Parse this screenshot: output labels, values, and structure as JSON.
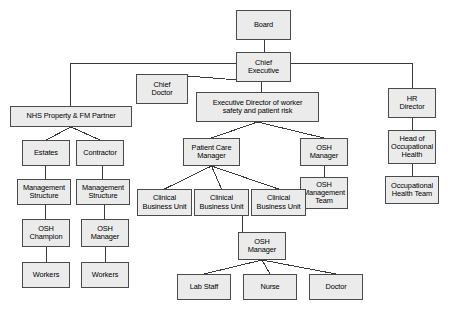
{
  "diagram": {
    "type": "organizational-chart",
    "background_color": "#ffffff",
    "node_fill_color": "#ebebeb",
    "node_border_color": "#4a4a4a",
    "connector_color": "#3a3a3a",
    "nodes": [
      {
        "id": "board",
        "label": "Board",
        "x": 236,
        "y": 10,
        "w": 55,
        "h": 30
      },
      {
        "id": "chief_executive",
        "label": "Chief\nExecutive",
        "x": 236,
        "y": 52,
        "w": 55,
        "h": 30
      },
      {
        "id": "chief_doctor",
        "label": "Chief\nDoctor",
        "x": 136,
        "y": 74,
        "w": 52,
        "h": 30
      },
      {
        "id": "exec_director",
        "label": "Executive Director of worker\nsafety and patient risk",
        "x": 196,
        "y": 92,
        "w": 123,
        "h": 30
      },
      {
        "id": "hr_director",
        "label": "HR\nDirector",
        "x": 388,
        "y": 88,
        "w": 48,
        "h": 30
      },
      {
        "id": "nhs_property",
        "label": "NHS Property & FM Partner",
        "x": 10,
        "y": 106,
        "w": 122,
        "h": 21
      },
      {
        "id": "head_occ_health",
        "label": "Head of\nOccupational\nHealth",
        "x": 388,
        "y": 130,
        "w": 48,
        "h": 34
      },
      {
        "id": "occ_health_team",
        "label": "Occupational\nHealth Team",
        "x": 385,
        "y": 176,
        "w": 54,
        "h": 28
      },
      {
        "id": "estates",
        "label": "Estates",
        "x": 22,
        "y": 140,
        "w": 48,
        "h": 26
      },
      {
        "id": "contractor",
        "label": "Contractor",
        "x": 76,
        "y": 140,
        "w": 48,
        "h": 26
      },
      {
        "id": "patient_care_mgr",
        "label": "Patient Care\nManager",
        "x": 183,
        "y": 138,
        "w": 57,
        "h": 28
      },
      {
        "id": "osh_manager_right",
        "label": "OSH\nManager",
        "x": 300,
        "y": 138,
        "w": 48,
        "h": 28
      },
      {
        "id": "mgmt_structure_1",
        "label": "Management\nStructure",
        "x": 17,
        "y": 179,
        "w": 54,
        "h": 26
      },
      {
        "id": "mgmt_structure_2",
        "label": "Management\nStructure",
        "x": 76,
        "y": 179,
        "w": 54,
        "h": 26
      },
      {
        "id": "osh_mgmt_team",
        "label": "OSH\nManagement\nTeam",
        "x": 300,
        "y": 177,
        "w": 48,
        "h": 32
      },
      {
        "id": "cbu_1",
        "label": "Clinical\nBusiness Unit",
        "x": 137,
        "y": 189,
        "w": 55,
        "h": 27
      },
      {
        "id": "cbu_2",
        "label": "Clinical\nBusiness Unit",
        "x": 194,
        "y": 189,
        "w": 55,
        "h": 27
      },
      {
        "id": "cbu_3",
        "label": "Clinical\nBusiness Unit",
        "x": 251,
        "y": 189,
        "w": 55,
        "h": 27
      },
      {
        "id": "osh_champion",
        "label": "OSH\nChampion",
        "x": 22,
        "y": 219,
        "w": 48,
        "h": 28
      },
      {
        "id": "osh_manager_left",
        "label": "OSH\nManager",
        "x": 81,
        "y": 219,
        "w": 48,
        "h": 28
      },
      {
        "id": "osh_manager_bottom",
        "label": "OSH\nManager",
        "x": 238,
        "y": 232,
        "w": 48,
        "h": 28
      },
      {
        "id": "workers_1",
        "label": "Workers",
        "x": 22,
        "y": 262,
        "w": 48,
        "h": 26
      },
      {
        "id": "workers_2",
        "label": "Workers",
        "x": 81,
        "y": 262,
        "w": 48,
        "h": 26
      },
      {
        "id": "lab_staff",
        "label": "Lab Staff",
        "x": 177,
        "y": 274,
        "w": 54,
        "h": 26
      },
      {
        "id": "nurse",
        "label": "Nurse",
        "x": 243,
        "y": 274,
        "w": 54,
        "h": 26
      },
      {
        "id": "doctor",
        "label": "Doctor",
        "x": 309,
        "y": 274,
        "w": 54,
        "h": 26
      }
    ],
    "edges": [
      {
        "from": "board",
        "to": "chief_executive",
        "style": "vertical"
      },
      {
        "from": "chief_executive",
        "to": "nhs_property",
        "style": "bus-left"
      },
      {
        "from": "chief_executive",
        "to": "hr_director",
        "style": "bus-right"
      },
      {
        "from": "chief_executive",
        "to": "chief_doctor",
        "style": "diagonal"
      },
      {
        "from": "chief_executive",
        "to": "exec_director",
        "style": "vertical"
      },
      {
        "from": "exec_director",
        "to": "patient_care_mgr",
        "style": "diagonal"
      },
      {
        "from": "exec_director",
        "to": "osh_manager_right",
        "style": "diagonal"
      },
      {
        "from": "osh_manager_right",
        "to": "osh_mgmt_team",
        "style": "vertical"
      },
      {
        "from": "hr_director",
        "to": "head_occ_health",
        "style": "vertical"
      },
      {
        "from": "head_occ_health",
        "to": "occ_health_team",
        "style": "vertical"
      },
      {
        "from": "nhs_property",
        "to": "estates",
        "style": "diagonal"
      },
      {
        "from": "nhs_property",
        "to": "contractor",
        "style": "diagonal"
      },
      {
        "from": "estates",
        "to": "mgmt_structure_1",
        "style": "vertical"
      },
      {
        "from": "contractor",
        "to": "mgmt_structure_2",
        "style": "vertical"
      },
      {
        "from": "mgmt_structure_1",
        "to": "osh_champion",
        "style": "vertical"
      },
      {
        "from": "mgmt_structure_2",
        "to": "osh_manager_left",
        "style": "vertical"
      },
      {
        "from": "osh_champion",
        "to": "workers_1",
        "style": "vertical"
      },
      {
        "from": "osh_manager_left",
        "to": "workers_2",
        "style": "vertical"
      },
      {
        "from": "patient_care_mgr",
        "to": "cbu_1",
        "style": "diagonal"
      },
      {
        "from": "patient_care_mgr",
        "to": "cbu_2",
        "style": "diagonal"
      },
      {
        "from": "patient_care_mgr",
        "to": "cbu_3",
        "style": "diagonal"
      },
      {
        "from": "cbu_2",
        "to": "osh_manager_bottom",
        "style": "vertical"
      },
      {
        "from": "osh_manager_bottom",
        "to": "lab_staff",
        "style": "diagonal"
      },
      {
        "from": "osh_manager_bottom",
        "to": "nurse",
        "style": "diagonal"
      },
      {
        "from": "osh_manager_bottom",
        "to": "doctor",
        "style": "diagonal"
      }
    ],
    "bus": {
      "y": 63,
      "left_x": 70,
      "right_x": 412
    }
  }
}
